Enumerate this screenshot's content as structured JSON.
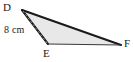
{
  "figure": {
    "kind": "geometry-triangle-diagram",
    "shape_name": "triangle-DEF",
    "background_color": "#ffffff",
    "fill_color": "#e8e8e8",
    "stroke_color": "#1a1a1a",
    "dashed_stroke_color": "#9a9a9a",
    "vertices": [
      {
        "id": "D",
        "label": "D",
        "x": 22,
        "y": 10
      },
      {
        "id": "E",
        "label": "E",
        "x": 48,
        "y": 44
      },
      {
        "id": "F",
        "label": "F",
        "x": 121,
        "y": 45
      }
    ],
    "labels": {
      "vertex_d": "D",
      "vertex_e": "E",
      "vertex_f": "F"
    },
    "measurements": [
      {
        "id": "side-DE",
        "text": "8 cm",
        "value": 8,
        "unit": "cm",
        "applies_to": "D-E"
      }
    ],
    "dashed_segment": {
      "from": "D",
      "to": "E",
      "style": "dashed"
    }
  }
}
